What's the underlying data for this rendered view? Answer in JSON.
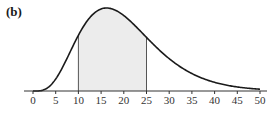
{
  "panel_label": "(b)",
  "chart_data": {
    "type": "area",
    "title": "",
    "xlabel": "",
    "ylabel": "",
    "xlim": [
      0,
      50
    ],
    "x_ticks": [
      0,
      5,
      10,
      15,
      20,
      25,
      30,
      35,
      40,
      45,
      50
    ],
    "x_tick_labels": [
      "0",
      "5",
      "10",
      "15",
      "20",
      "25",
      "30",
      "35",
      "40",
      "45",
      "50"
    ],
    "y_axis_visible": false,
    "grid": false,
    "legend": null,
    "curve": {
      "shape": "gamma-like right-skewed density",
      "mode": 16.2,
      "shape_k": 5,
      "scale_theta": 4.05,
      "sample_points": [
        {
          "x": 0,
          "y": 0.0
        },
        {
          "x": 2.5,
          "y": 0.0
        },
        {
          "x": 5,
          "y": 0.08
        },
        {
          "x": 7.5,
          "y": 0.3
        },
        {
          "x": 10,
          "y": 0.67
        },
        {
          "x": 12.5,
          "y": 0.91
        },
        {
          "x": 15,
          "y": 0.99
        },
        {
          "x": 16.2,
          "y": 1.0
        },
        {
          "x": 17.5,
          "y": 0.99
        },
        {
          "x": 20,
          "y": 0.94
        },
        {
          "x": 22.5,
          "y": 0.8
        },
        {
          "x": 25,
          "y": 0.645
        },
        {
          "x": 30,
          "y": 0.37
        },
        {
          "x": 35,
          "y": 0.18
        },
        {
          "x": 40,
          "y": 0.08
        },
        {
          "x": 45,
          "y": 0.03
        },
        {
          "x": 50,
          "y": 0.01
        }
      ]
    },
    "shaded_region": {
      "from": 10,
      "to": 25,
      "color": "#ececec"
    },
    "colors": {
      "curve": "#1a1a1a",
      "axis": "#333333",
      "bounds": "#555555"
    }
  }
}
